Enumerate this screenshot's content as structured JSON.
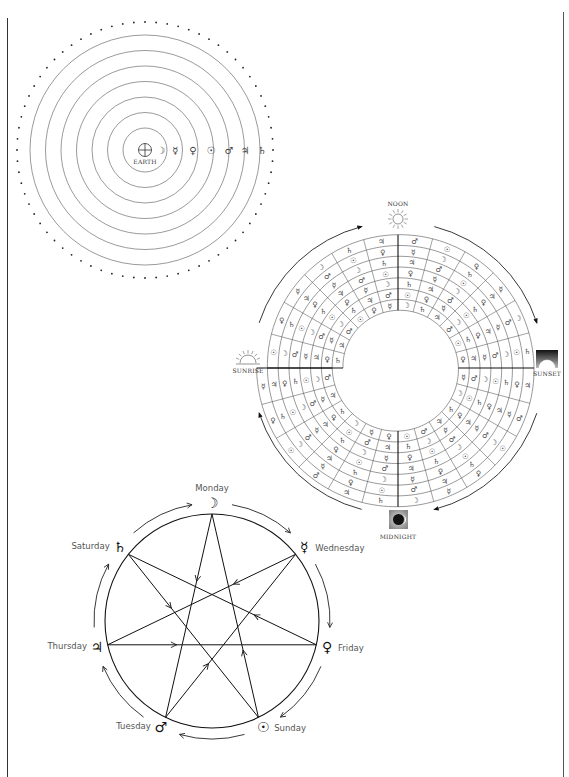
{
  "page": {
    "colors": {
      "ink": "#222222",
      "light_ink": "#555555",
      "paper": "#ffffff",
      "grey_box": "#9a9a9a"
    }
  },
  "geocentric": {
    "center_label": "EARTH",
    "center_symbol": "⊕",
    "planets": [
      {
        "name": "Moon",
        "symbol": "☽"
      },
      {
        "name": "Mercury",
        "symbol": "☿"
      },
      {
        "name": "Venus",
        "symbol": "♀"
      },
      {
        "name": "Sun",
        "symbol": "☉"
      },
      {
        "name": "Mars",
        "symbol": "♂"
      },
      {
        "name": "Jupiter",
        "symbol": "♃"
      },
      {
        "name": "Saturn",
        "symbol": "♄"
      }
    ],
    "sphere_count": 7,
    "fixed_stars": "dotted outer ring"
  },
  "hours_wheel": {
    "labels": {
      "noon": "NOON",
      "sunset": "SUNSET",
      "midnight": "MIDNIGHT",
      "sunrise": "SUNRISE"
    },
    "days_outer_to_inner": [
      "Sunday",
      "Monday",
      "Tuesday",
      "Wednesday",
      "Thursday",
      "Friday",
      "Saturday"
    ],
    "hours_per_day": 24,
    "symbols": {
      "Sunday": [
        "☉",
        "♀",
        "☿",
        "☽",
        "♄",
        "♃",
        "♂",
        "☉",
        "♀",
        "☿",
        "☽",
        "♄",
        "♃",
        "♂",
        "☉",
        "♀",
        "☿",
        "☽",
        "♄",
        "♃",
        "♂",
        "☉",
        "♀",
        "☿"
      ],
      "Monday": [
        "☽",
        "♄",
        "♃",
        "♂",
        "☉",
        "♀",
        "☿",
        "☽",
        "♄",
        "♃",
        "♂",
        "☉",
        "♀",
        "☿",
        "☽",
        "♄",
        "♃",
        "♂",
        "☉",
        "♀",
        "☿",
        "☽",
        "♄",
        "♃"
      ],
      "Tuesday": [
        "♂",
        "☉",
        "♀",
        "☿",
        "☽",
        "♄",
        "♃",
        "♂",
        "☉",
        "♀",
        "☿",
        "☽",
        "♄",
        "♃",
        "♂",
        "☉",
        "♀",
        "☿",
        "☽",
        "♄",
        "♃",
        "♂",
        "☉",
        "♀"
      ],
      "Wednesday": [
        "☿",
        "☽",
        "♄",
        "♃",
        "♂",
        "☉",
        "♀",
        "☿",
        "☽",
        "♄",
        "♃",
        "♂",
        "☉",
        "♀",
        "☿",
        "☽",
        "♄",
        "♃",
        "♂",
        "☉",
        "♀",
        "☿",
        "☽",
        "♄"
      ],
      "Thursday": [
        "♃",
        "♂",
        "☉",
        "♀",
        "☿",
        "☽",
        "♄",
        "♃",
        "♂",
        "☉",
        "♀",
        "☿",
        "☽",
        "♄",
        "♃",
        "♂",
        "☉",
        "♀",
        "☿",
        "☽",
        "♄",
        "♃",
        "♂",
        "☉"
      ],
      "Friday": [
        "♀",
        "☿",
        "☽",
        "♄",
        "♃",
        "♂",
        "☉",
        "♀",
        "☿",
        "☽",
        "♄",
        "♃",
        "♂",
        "☉",
        "♀",
        "☿",
        "☽",
        "♄",
        "♃",
        "♂",
        "☉",
        "♀",
        "☿",
        "☽"
      ],
      "Saturday": [
        "♄",
        "♃",
        "♂",
        "☉",
        "♀",
        "☿",
        "☽",
        "♄",
        "♃",
        "♂",
        "☉",
        "♀",
        "☿",
        "☽",
        "♄",
        "♃",
        "♂",
        "☉",
        "♀",
        "☿",
        "☽",
        "♄",
        "♃",
        "♂"
      ]
    },
    "direction": "clockwise"
  },
  "week_star": {
    "days": [
      {
        "day": "Monday",
        "symbol": "☽"
      },
      {
        "day": "Wednesday",
        "symbol": "☿"
      },
      {
        "day": "Friday",
        "symbol": "♀"
      },
      {
        "day": "Sunday",
        "symbol": "☉"
      },
      {
        "day": "Tuesday",
        "symbol": "♂"
      },
      {
        "day": "Thursday",
        "symbol": "♃"
      },
      {
        "day": "Saturday",
        "symbol": "♄"
      }
    ],
    "star_sequence": [
      "Sunday",
      "Monday",
      "Tuesday",
      "Wednesday",
      "Thursday",
      "Friday",
      "Saturday"
    ]
  }
}
